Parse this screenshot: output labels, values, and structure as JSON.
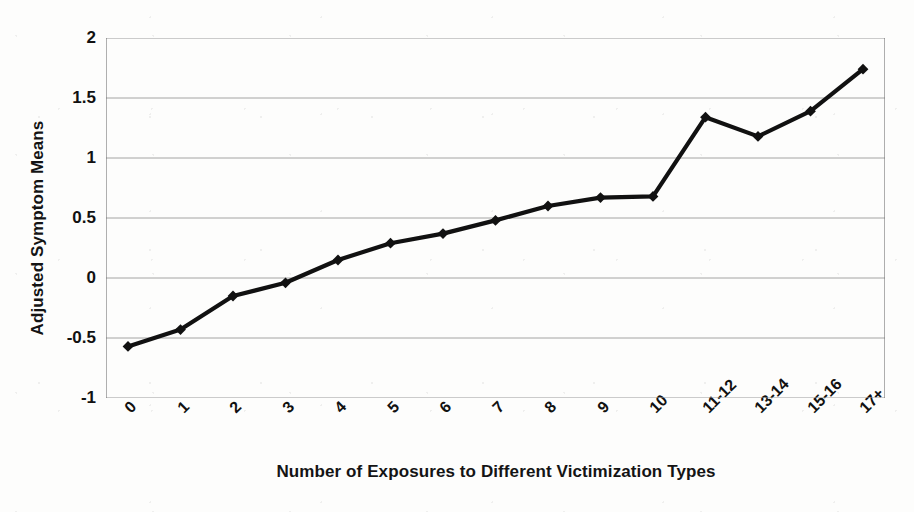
{
  "chart_data": {
    "type": "line",
    "title": "",
    "xlabel": "Number of Exposures to Different Victimization Types",
    "ylabel": "Adjusted Symptom Means",
    "categories": [
      "0",
      "1",
      "2",
      "3",
      "4",
      "5",
      "6",
      "7",
      "8",
      "9",
      "10",
      "11-12",
      "13-14",
      "15-16",
      "17+"
    ],
    "values": [
      -0.57,
      -0.43,
      -0.15,
      -0.04,
      0.15,
      0.29,
      0.37,
      0.48,
      0.6,
      0.67,
      0.68,
      1.34,
      1.18,
      1.39,
      1.74
    ],
    "ylim": [
      -1,
      2
    ],
    "ytick_labels": [
      "2",
      "1.5",
      "1",
      "0.5",
      "0",
      "-0.5",
      "-1"
    ],
    "ytick_values": [
      2,
      1.5,
      1,
      0.5,
      0,
      -0.5,
      -1
    ],
    "grid": true,
    "grid_axis": "y",
    "legend": false,
    "marker": "diamond",
    "line_color": "#111111",
    "marker_color": "#111111",
    "grid_color": "#9a9a9a",
    "axis_color": "#6e6e6e",
    "background": "#fdfdfc",
    "xtick_rotation": -45
  }
}
